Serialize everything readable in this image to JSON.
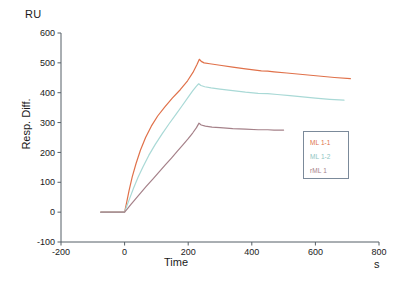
{
  "chart_data": {
    "type": "line",
    "title": "",
    "subtitle": "",
    "xlabel": "Time",
    "ylabel": "Resp. Diff.",
    "x_unit": "s",
    "y_unit": "RU",
    "xlim": [
      -200,
      800
    ],
    "ylim": [
      -100,
      600
    ],
    "xticks": [
      -200,
      0,
      200,
      400,
      600,
      800
    ],
    "yticks": [
      -100,
      0,
      100,
      200,
      300,
      400,
      500,
      600
    ],
    "xtick_labels": [
      "-200",
      "0",
      "200",
      "400",
      "600",
      "800"
    ],
    "ytick_labels": [
      "-100",
      "0",
      "100",
      "200",
      "300",
      "400",
      "500",
      "600"
    ],
    "grid": false,
    "legend_position": "lower-right",
    "series": [
      {
        "name": "ML 1-1",
        "color": "#e0714a",
        "points": [
          [
            -75,
            0
          ],
          [
            -40,
            0
          ],
          [
            -10,
            0
          ],
          [
            0,
            0
          ],
          [
            6,
            30
          ],
          [
            14,
            72
          ],
          [
            24,
            118
          ],
          [
            36,
            163
          ],
          [
            50,
            208
          ],
          [
            66,
            250
          ],
          [
            84,
            288
          ],
          [
            104,
            322
          ],
          [
            126,
            352
          ],
          [
            150,
            382
          ],
          [
            175,
            410
          ],
          [
            198,
            440
          ],
          [
            215,
            468
          ],
          [
            228,
            495
          ],
          [
            235,
            512
          ],
          [
            241,
            505
          ],
          [
            250,
            500
          ],
          [
            268,
            497
          ],
          [
            300,
            492
          ],
          [
            340,
            486
          ],
          [
            380,
            480
          ],
          [
            430,
            473
          ],
          [
            450,
            472
          ],
          [
            470,
            470
          ],
          [
            510,
            466
          ],
          [
            560,
            461
          ],
          [
            610,
            456
          ],
          [
            660,
            451
          ],
          [
            710,
            447
          ]
        ]
      },
      {
        "name": "ML 1-2",
        "color": "#a9d9d6",
        "points": [
          [
            -75,
            0
          ],
          [
            -40,
            0
          ],
          [
            -10,
            0
          ],
          [
            0,
            0
          ],
          [
            6,
            18
          ],
          [
            16,
            46
          ],
          [
            28,
            80
          ],
          [
            42,
            116
          ],
          [
            58,
            152
          ],
          [
            76,
            190
          ],
          [
            96,
            226
          ],
          [
            118,
            262
          ],
          [
            140,
            296
          ],
          [
            162,
            328
          ],
          [
            182,
            358
          ],
          [
            200,
            385
          ],
          [
            214,
            406
          ],
          [
            226,
            422
          ],
          [
            233,
            430
          ],
          [
            240,
            424
          ],
          [
            252,
            420
          ],
          [
            272,
            416
          ],
          [
            300,
            412
          ],
          [
            340,
            407
          ],
          [
            380,
            402
          ],
          [
            420,
            398
          ],
          [
            450,
            397
          ],
          [
            480,
            394
          ],
          [
            520,
            390
          ],
          [
            560,
            386
          ],
          [
            600,
            382
          ],
          [
            645,
            378
          ],
          [
            690,
            375
          ]
        ]
      },
      {
        "name": "rML 1",
        "color": "#a58189",
        "points": [
          [
            -75,
            0
          ],
          [
            -40,
            0
          ],
          [
            -10,
            0
          ],
          [
            0,
            0
          ],
          [
            8,
            10
          ],
          [
            20,
            26
          ],
          [
            34,
            44
          ],
          [
            50,
            64
          ],
          [
            68,
            86
          ],
          [
            88,
            110
          ],
          [
            108,
            134
          ],
          [
            128,
            158
          ],
          [
            148,
            182
          ],
          [
            166,
            204
          ],
          [
            184,
            226
          ],
          [
            200,
            246
          ],
          [
            214,
            265
          ],
          [
            226,
            283
          ],
          [
            234,
            298
          ],
          [
            241,
            292
          ],
          [
            254,
            288
          ],
          [
            275,
            285
          ],
          [
            300,
            283
          ],
          [
            340,
            280
          ],
          [
            380,
            278
          ],
          [
            420,
            276
          ],
          [
            450,
            276
          ],
          [
            470,
            275
          ],
          [
            500,
            275
          ]
        ]
      }
    ]
  },
  "legend": {
    "entries": [
      {
        "label": "ML 1-1",
        "color": "#e0714a"
      },
      {
        "label": "ML 1-2",
        "color": "#8fc5c2"
      },
      {
        "label": "rML 1",
        "color": "#a58189"
      }
    ]
  }
}
